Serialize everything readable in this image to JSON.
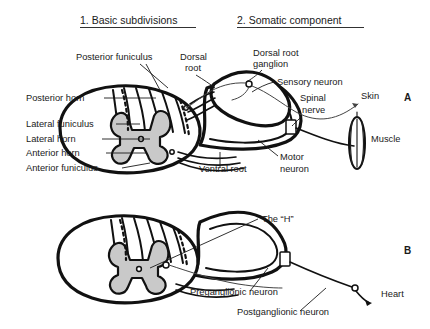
{
  "figure": {
    "headings": [
      {
        "id": "heading-basic-subdivisions",
        "text": "1. Basic subdivisions",
        "x": 80,
        "y": 24
      },
      {
        "id": "heading-somatic-component",
        "text": "2. Somatic component",
        "x": 237,
        "y": 24
      }
    ],
    "panel_markers": [
      {
        "id": "panel-marker-a",
        "text": "A",
        "x": 404,
        "y": 101
      },
      {
        "id": "panel-marker-b",
        "text": "B",
        "x": 404,
        "y": 254
      }
    ]
  },
  "panel_a": {
    "name": "somatic-component-panel",
    "labels": [
      {
        "id": "label-posterior-funiculus",
        "text": "Posterior funiculus",
        "x": 76,
        "y": 60,
        "anchor": "start"
      },
      {
        "id": "label-dorsal-root-line1",
        "text": "Dorsal",
        "x": 180,
        "y": 60,
        "anchor": "start"
      },
      {
        "id": "label-dorsal-root-line2",
        "text": "root",
        "x": 185,
        "y": 71,
        "anchor": "start"
      },
      {
        "id": "label-dorsal-root-ganglion-line1",
        "text": "Dorsal root",
        "x": 253,
        "y": 56,
        "anchor": "start"
      },
      {
        "id": "label-dorsal-root-ganglion-line2",
        "text": "ganglion",
        "x": 253,
        "y": 67,
        "anchor": "start"
      },
      {
        "id": "label-sensory-neuron",
        "text": "Sensory neuron",
        "x": 277,
        "y": 85,
        "anchor": "start"
      },
      {
        "id": "label-skin",
        "text": "Skin",
        "x": 361,
        "y": 99,
        "anchor": "start"
      },
      {
        "id": "label-spinal-nerve-line1",
        "text": "Spinal",
        "x": 300,
        "y": 101,
        "anchor": "start"
      },
      {
        "id": "label-spinal-nerve-line2",
        "text": "nerve",
        "x": 302,
        "y": 113,
        "anchor": "start"
      },
      {
        "id": "label-muscle",
        "text": "Muscle",
        "x": 371,
        "y": 142,
        "anchor": "start"
      },
      {
        "id": "label-posterior-horn",
        "text": "Posterior horn",
        "x": 26,
        "y": 101,
        "anchor": "start"
      },
      {
        "id": "label-lateral-funiculus",
        "text": "Lateral funiculus",
        "x": 26,
        "y": 127,
        "anchor": "start"
      },
      {
        "id": "label-lateral-horn",
        "text": "Lateral horn",
        "x": 26,
        "y": 142,
        "anchor": "start"
      },
      {
        "id": "label-anterior-horn",
        "text": "Anterior horn",
        "x": 26,
        "y": 156,
        "anchor": "start"
      },
      {
        "id": "label-anterior-funiculus",
        "text": "Anterior funiculus",
        "x": 26,
        "y": 171,
        "anchor": "start"
      },
      {
        "id": "label-ventral-root",
        "text": "Ventral root",
        "x": 199,
        "y": 172,
        "anchor": "start"
      },
      {
        "id": "label-motor-neuron-line1",
        "text": "Motor",
        "x": 280,
        "y": 160,
        "anchor": "start"
      },
      {
        "id": "label-motor-neuron-line2",
        "text": "neuron",
        "x": 280,
        "y": 172,
        "anchor": "start"
      }
    ]
  },
  "panel_b": {
    "name": "autonomic-component-panel",
    "labels": [
      {
        "id": "label-the-h",
        "text": "The “H”",
        "x": 262,
        "y": 222,
        "anchor": "start"
      },
      {
        "id": "label-preganglionic-neuron",
        "text": "Preganglionic neuron",
        "x": 190,
        "y": 295,
        "anchor": "start"
      },
      {
        "id": "label-postganglionic-neuron",
        "text": "Postganglionic neuron",
        "x": 237,
        "y": 315,
        "anchor": "start"
      },
      {
        "id": "label-heart",
        "text": "Heart",
        "x": 381,
        "y": 297,
        "anchor": "start"
      }
    ]
  },
  "colors": {
    "gray_matter": "#c9c9c9",
    "outline": "#111111",
    "text": "#1a1a1a",
    "background": "#ffffff"
  }
}
